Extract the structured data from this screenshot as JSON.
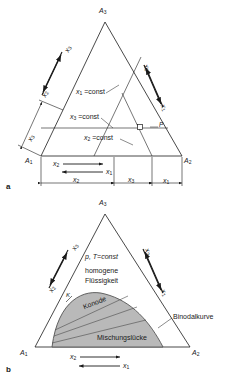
{
  "figure": {
    "background": "#ffffff",
    "line_color": "#1a1a1a",
    "shade_color": "#b9b9b9",
    "shade_edge": "#555555"
  },
  "panel_a": {
    "letter": "a",
    "corners": {
      "top": "A",
      "top_sub": "3",
      "left": "A",
      "left_sub": "1",
      "right": "A",
      "right_sub": "2"
    },
    "iso_lines": [
      {
        "name": "x1-const",
        "text": "x",
        "sub": "1",
        "tail": " =const"
      },
      {
        "name": "x3-const",
        "text": "x",
        "sub": "3",
        "tail": " =const"
      },
      {
        "name": "x2-const",
        "text": "x",
        "sub": "2",
        "tail": " =const"
      }
    ],
    "point_label": "P",
    "edge_arrows": {
      "left_up": {
        "text": "x",
        "sub": "3"
      },
      "left_down": {
        "text": "x",
        "sub": "2"
      },
      "right_up": {
        "text": "x",
        "sub": "3"
      },
      "right_down": {
        "text": "x",
        "sub": "1"
      }
    },
    "base_arrows": {
      "right_arrow": {
        "text": "x",
        "sub": "2"
      },
      "left_arrow": {
        "text": "x",
        "sub": "1"
      }
    },
    "dimensions": [
      {
        "name": "dim-x2",
        "text": "x",
        "sub": "2"
      },
      {
        "name": "dim-x3",
        "text": "x",
        "sub": "3"
      },
      {
        "name": "dim-x1",
        "text": "x",
        "sub": "1"
      },
      {
        "name": "dim-x3-left",
        "text": "x",
        "sub": "3"
      }
    ]
  },
  "panel_b": {
    "letter": "b",
    "corners": {
      "top": "A",
      "top_sub": "3",
      "left": "A",
      "left_sub": "1",
      "right": "A",
      "right_sub": "2"
    },
    "condition": "p, T=const",
    "region_line1": "homogene",
    "region_line2": "Flüssigkeit",
    "tie_line_label": "Konode",
    "gap_label": "Mischungslücke",
    "binodal_label": "Binodalkurve",
    "critical_point": "K",
    "edge_arrows": {
      "left_up": {
        "text": "x",
        "sub": "3"
      },
      "left_down": {
        "text": "x",
        "sub": "2"
      },
      "right_up": {
        "text": "x",
        "sub": "3"
      },
      "right_down": {
        "text": "x",
        "sub": "1"
      }
    },
    "base_arrows": {
      "right_arrow": {
        "text": "x",
        "sub": "2"
      },
      "left_arrow": {
        "text": "x",
        "sub": "1"
      }
    }
  }
}
